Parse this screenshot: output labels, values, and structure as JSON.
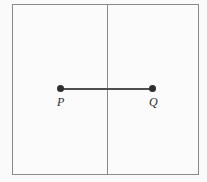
{
  "figure": {
    "type": "geometry-diagram",
    "frame": {
      "border_color": "#8a8a8a",
      "fill_color": "#fbfbfb",
      "x": 12,
      "y": 4,
      "width": 187,
      "height": 171
    },
    "divider": {
      "name": "vertical-line",
      "orientation": "vertical",
      "color": "#8a8a8a",
      "x": 107
    },
    "segment": {
      "name": "segment-PQ",
      "color": "#4f4f4f",
      "thickness": 2,
      "from": {
        "label": "P",
        "x": 60,
        "y": 89
      },
      "to": {
        "label": "Q",
        "x": 152,
        "y": 89
      }
    },
    "points": [
      {
        "label": "P",
        "dot_color": "#2e2e2e",
        "x": 60,
        "y": 89
      },
      {
        "label": "Q",
        "dot_color": "#2e2e2e",
        "x": 152,
        "y": 89
      }
    ]
  },
  "background_color": "#fafafa"
}
